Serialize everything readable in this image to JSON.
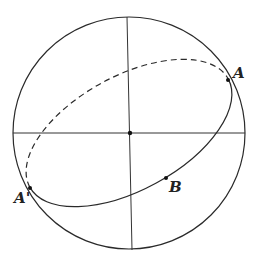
{
  "diagram": {
    "colors": {
      "stroke": "#2a2a2a",
      "background": "#ffffff"
    },
    "sphere": {
      "cx": 129,
      "cy": 133,
      "r": 116
    },
    "center_point": {
      "x": 130,
      "y": 133
    },
    "great_circle": {
      "cx": 129,
      "cy": 133,
      "rx": 113,
      "ry": 57,
      "rotation_deg": -28.6
    },
    "points": [
      {
        "id": "A",
        "label": "A",
        "x": 228,
        "y": 80,
        "label_x": 233,
        "label_y": 78
      },
      {
        "id": "A_prime",
        "label": "A'",
        "x": 30,
        "y": 188,
        "label_x": 14,
        "label_y": 203
      },
      {
        "id": "B",
        "label": "B",
        "x": 166,
        "y": 178,
        "label_x": 169,
        "label_y": 192
      }
    ]
  }
}
